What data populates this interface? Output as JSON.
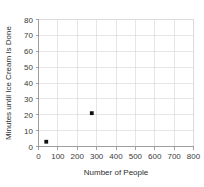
{
  "chart_data": {
    "type": "scatter",
    "title": "",
    "xlabel": "Number of People",
    "ylabel": "Minutes until Ice Cream Is Done",
    "xlim": [
      0,
      800
    ],
    "ylim": [
      0,
      80
    ],
    "xticks": [
      0,
      100,
      200,
      300,
      400,
      500,
      600,
      700,
      800
    ],
    "yticks": [
      0,
      10,
      20,
      30,
      40,
      50,
      60,
      70,
      80
    ],
    "xtick_labels": [
      "0",
      "100",
      "200",
      "300",
      "400",
      "500",
      "600",
      "700",
      "800"
    ],
    "ytick_labels": [
      "0",
      "10",
      "20",
      "30",
      "40",
      "50",
      "60",
      "70",
      "80"
    ],
    "grid": true,
    "legend": null,
    "marker": "square",
    "marker_color": "#101010",
    "points": [
      {
        "x": 40,
        "y": 3
      },
      {
        "x": 275,
        "y": 21
      }
    ]
  },
  "colors": {
    "grid": "#d6d6d6",
    "axis": "#8c8c8c",
    "text": "#3a3a3a",
    "marker": "#101010",
    "background": "#ffffff"
  }
}
